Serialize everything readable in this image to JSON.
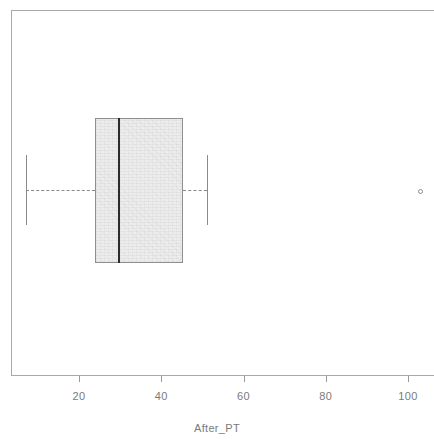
{
  "chart_data": {
    "type": "boxplot",
    "title": "",
    "subtitle": "",
    "xlabel": "After_PT",
    "ylabel": "",
    "orientation": "horizontal",
    "grid": false,
    "legend": null,
    "xlim": [
      7,
      110
    ],
    "x_ticks": [
      20,
      40,
      60,
      80,
      100
    ],
    "x_tick_labels": [
      "20",
      "40",
      "60",
      "80",
      "100"
    ],
    "series": [
      {
        "name": "After_PT",
        "min_whisker": 7,
        "q1": 24,
        "median": 30,
        "q3": 45,
        "max_whisker": 51,
        "outliers": [
          102
        ]
      }
    ]
  },
  "axis": {
    "x_label": "After_PT",
    "ticks": [
      {
        "value": 20,
        "label": "20"
      },
      {
        "value": 40,
        "label": "40"
      },
      {
        "value": 60,
        "label": "60"
      },
      {
        "value": 80,
        "label": "80"
      },
      {
        "value": 100,
        "label": "100"
      }
    ]
  },
  "colors": {
    "frame": "#a8a8a8",
    "box_fill": "#ededed",
    "box_border": "#8f8f8f",
    "median": "#2b2b2b",
    "whisker": "#8a8a8a",
    "text": "#7a7a7a",
    "background": "#ffffff"
  },
  "geometry": {
    "x_px_at_20": 79,
    "x_px_at_100": 408,
    "box_left_px": 95,
    "box_right_px": 183,
    "box_top_px": 118,
    "box_bottom_px": 263,
    "median_px": 118,
    "whisker_left_px": 26,
    "whisker_right_px": 207,
    "whisker_cap_top_px": 155,
    "whisker_cap_bottom_px": 225,
    "center_y_px": 190,
    "outlier_x_px": 420,
    "outlier_y_px": 191
  }
}
